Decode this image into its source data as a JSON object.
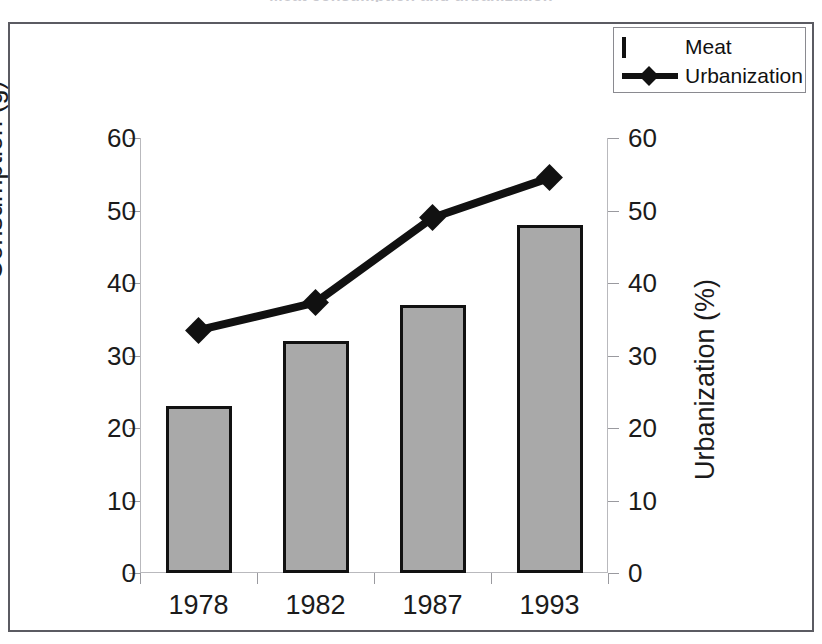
{
  "chart_data": {
    "type": "bar",
    "title": "Meat consumption and urbanization",
    "title_visibility": "cropped-at-top-edge",
    "categories": [
      "1978",
      "1982",
      "1987",
      "1993"
    ],
    "series": [
      {
        "name": "Meat",
        "type": "bar",
        "axis": "left",
        "values": [
          23,
          32,
          37,
          48
        ],
        "color": "#a9a9a9",
        "border_color": "#111111"
      },
      {
        "name": "Urbanization",
        "type": "line",
        "axis": "right",
        "values": [
          33.5,
          37.3,
          49.0,
          54.5
        ],
        "color": "#111111",
        "marker": "diamond"
      }
    ],
    "xlabel": "",
    "ylabel": "Consumption (g)",
    "ylabel_right": "Urbanization (%)",
    "ylim": [
      0,
      60
    ],
    "ylim_right": [
      0,
      60
    ],
    "yticks": [
      0,
      10,
      20,
      30,
      40,
      50,
      60
    ],
    "yticks_right": [
      0,
      10,
      20,
      30,
      40,
      50,
      60
    ],
    "grid": false,
    "legend_position": "top-right"
  },
  "axes": {
    "left": {
      "title": "Consumption (g)",
      "ticks": [
        "60",
        "50",
        "40",
        "30",
        "20",
        "10",
        "0"
      ]
    },
    "right": {
      "title": "Urbanization (%)",
      "ticks": [
        "60",
        "50",
        "40",
        "30",
        "20",
        "10",
        "0"
      ]
    },
    "x": {
      "labels": [
        "1978",
        "1982",
        "1987",
        "1993"
      ]
    }
  },
  "legend": {
    "items": [
      {
        "label": "Meat",
        "key": "bar-swatch"
      },
      {
        "label": "Urbanization",
        "key": "line-diamond-swatch"
      }
    ]
  }
}
